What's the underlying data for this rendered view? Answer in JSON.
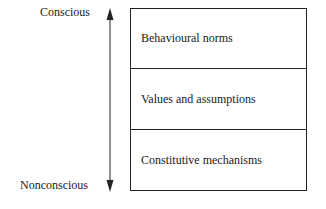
{
  "axis": {
    "top_label": "Conscious",
    "bottom_label": "Nonconscious"
  },
  "layers": [
    {
      "label": "Behavioural norms"
    },
    {
      "label": "Values and assumptions"
    },
    {
      "label": "Constitutive mechanisms"
    }
  ]
}
